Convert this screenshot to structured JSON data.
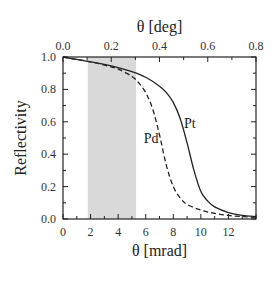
{
  "chart_data": {
    "type": "line",
    "title": "",
    "xlabel": "θ  [mrad]",
    "x2label": "θ  [deg]",
    "ylabel": "Reflectivity",
    "xlim": [
      0,
      14
    ],
    "x2lim": [
      0,
      0.8
    ],
    "ylim": [
      0,
      1.0
    ],
    "xticks": [
      "0",
      "2",
      "4",
      "6",
      "8",
      "10",
      "12"
    ],
    "x2ticks": [
      "0.0",
      "0.2",
      "0.4",
      "0.6",
      "0.8"
    ],
    "yticks": [
      "0.0",
      "0.2",
      "0.4",
      "0.6",
      "0.8",
      "1.0"
    ],
    "grid": false,
    "shaded_region": {
      "x_start": 1.8,
      "x_end": 5.3,
      "color": "#d9d9d9"
    },
    "series": [
      {
        "name": "Pt",
        "style": "solid",
        "color": "#222222",
        "x": [
          0,
          1,
          2,
          3,
          4,
          5,
          6,
          7,
          7.5,
          8,
          8.5,
          9,
          9.5,
          10,
          10.5,
          11,
          12,
          13,
          14
        ],
        "y": [
          1.0,
          0.985,
          0.97,
          0.955,
          0.935,
          0.91,
          0.875,
          0.82,
          0.78,
          0.72,
          0.62,
          0.47,
          0.3,
          0.17,
          0.11,
          0.075,
          0.04,
          0.022,
          0.015
        ]
      },
      {
        "name": "Pd",
        "style": "dashed",
        "color": "#222222",
        "x": [
          0,
          1,
          2,
          3,
          4,
          5,
          5.5,
          6,
          6.5,
          7,
          7.5,
          8,
          8.5,
          9,
          10,
          11,
          12,
          13,
          14
        ],
        "y": [
          1.0,
          0.985,
          0.97,
          0.95,
          0.925,
          0.88,
          0.84,
          0.78,
          0.68,
          0.52,
          0.33,
          0.2,
          0.13,
          0.09,
          0.055,
          0.035,
          0.022,
          0.015,
          0.01
        ]
      }
    ],
    "annotations": [
      {
        "text": "Pt",
        "x": 9.2,
        "y": 0.56
      },
      {
        "text": "Pd",
        "x": 6.4,
        "y": 0.47
      }
    ]
  }
}
